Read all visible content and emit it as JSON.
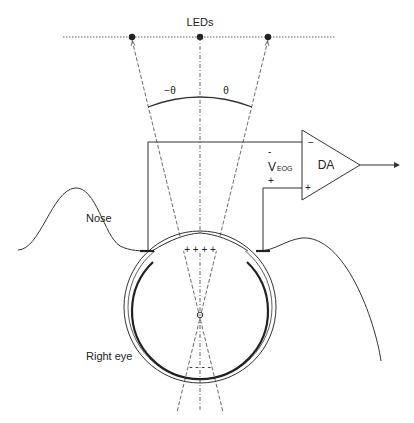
{
  "diagram": {
    "labels": {
      "leds": "LEDs",
      "neg_theta": "−θ",
      "pos_theta": "θ",
      "amplifier": "DA",
      "voltage_main": "V",
      "voltage_sub": "EOG",
      "voltage_minus": "-",
      "voltage_plus": "+",
      "amp_minus": "−",
      "amp_plus": "+",
      "nose": "Nose",
      "right_eye": "Right eye",
      "cornea_charges": "+ + +   +",
      "retina_charges": "-  -  -  -"
    },
    "colors": {
      "line": "#333333",
      "background": "#ffffff",
      "dot": "#222222"
    },
    "elements": [
      "LED row (3 LEDs, dotted baseline)",
      "Gaze lines at -θ, 0, θ",
      "Angle arc between -θ and θ",
      "Differential amplifier (DA) with - and + inputs and output arrow",
      "Electrode at nose side connected to - input",
      "Electrode at temple side connected to + input",
      "Eye globe with cornea bulge and retina",
      "Nose and face profile curve"
    ]
  }
}
